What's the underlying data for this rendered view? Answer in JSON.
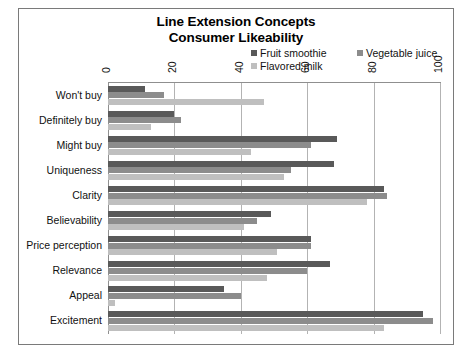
{
  "chart_data": {
    "type": "bar",
    "orientation": "horizontal",
    "title": "Line Extension Concepts Consumer Likeability",
    "title_lines": [
      "Line Extension Concepts",
      "Consumer Likeability"
    ],
    "xlabel": "",
    "ylabel": "",
    "xlim": [
      0,
      100
    ],
    "xticks": [
      0,
      20,
      40,
      60,
      80,
      100
    ],
    "tick_labels": [
      "0",
      "20",
      "40",
      "60",
      "80",
      "100"
    ],
    "grid": true,
    "legend_position": "top-right",
    "categories": [
      "Won't buy",
      "Definitely buy",
      "Might buy",
      "Uniqueness",
      "Clarity",
      "Believability",
      "Price perception",
      "Relevance",
      "Appeal",
      "Excitement"
    ],
    "series": [
      {
        "name": "Fruit smoothie",
        "color": "#595959",
        "values": [
          11,
          20,
          69,
          68,
          83,
          49,
          61,
          67,
          35,
          95
        ]
      },
      {
        "name": "Vegetable juice",
        "color": "#8c8c8c",
        "values": [
          17,
          22,
          61,
          55,
          84,
          45,
          61,
          60,
          40,
          98
        ]
      },
      {
        "name": "Flavored milk",
        "color": "#bfbfbf",
        "values": [
          47,
          13,
          43,
          53,
          78,
          41,
          51,
          48,
          2,
          83
        ]
      }
    ]
  },
  "frame": {
    "border_color": "#7a7a7a",
    "background": "#ffffff"
  }
}
